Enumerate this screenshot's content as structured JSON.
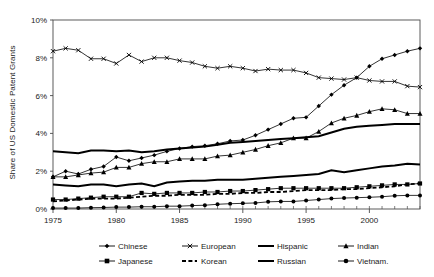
{
  "chart_data": {
    "type": "line",
    "title": "",
    "xlabel": "",
    "ylabel": "Share of US Domestic Patent Grants",
    "xlim": [
      1975,
      2004
    ],
    "ylim": [
      0,
      10
    ],
    "grid": false,
    "legend_position": "bottom",
    "x": [
      1975,
      1976,
      1977,
      1978,
      1979,
      1980,
      1981,
      1982,
      1983,
      1984,
      1985,
      1986,
      1987,
      1988,
      1989,
      1990,
      1991,
      1992,
      1993,
      1994,
      1995,
      1996,
      1997,
      1998,
      1999,
      2000,
      2001,
      2002,
      2003,
      2004
    ],
    "xticks": [
      1975,
      1980,
      1985,
      1990,
      1995,
      2000
    ],
    "xtick_labels": [
      "1975",
      "1980",
      "1985",
      "1990",
      "1995",
      "2000"
    ],
    "yticks": [
      0,
      2,
      4,
      6,
      8,
      10
    ],
    "ytick_labels": [
      "0%",
      "2%",
      "4%",
      "6%",
      "8%",
      "10%"
    ],
    "y_unit": "%",
    "series": [
      {
        "name": "Chinese",
        "marker": "diamond",
        "line": "solid",
        "values": [
          1.7,
          2.0,
          1.85,
          2.1,
          2.25,
          2.75,
          2.55,
          2.7,
          2.85,
          3.05,
          3.2,
          3.3,
          3.35,
          3.45,
          3.6,
          3.65,
          3.9,
          4.2,
          4.5,
          4.8,
          4.85,
          5.45,
          6.05,
          6.55,
          6.95,
          7.55,
          7.95,
          8.15,
          8.35,
          8.5
        ]
      },
      {
        "name": "European",
        "marker": "x",
        "line": "solid",
        "values": [
          8.35,
          8.5,
          8.4,
          7.95,
          7.95,
          7.7,
          8.15,
          7.8,
          8.0,
          8.0,
          7.85,
          7.75,
          7.55,
          7.45,
          7.55,
          7.45,
          7.3,
          7.4,
          7.35,
          7.35,
          7.2,
          6.95,
          6.9,
          6.85,
          6.95,
          6.8,
          6.75,
          6.75,
          6.5,
          6.45
        ]
      },
      {
        "name": "Hispanic",
        "marker": "none",
        "line": "solid-thick",
        "values": [
          3.05,
          3.0,
          2.95,
          3.1,
          3.1,
          3.05,
          3.1,
          3.0,
          3.05,
          3.15,
          3.2,
          3.25,
          3.3,
          3.4,
          3.5,
          3.55,
          3.6,
          3.65,
          3.7,
          3.75,
          3.8,
          3.85,
          4.05,
          4.25,
          4.35,
          4.4,
          4.45,
          4.5,
          4.5,
          4.5
        ]
      },
      {
        "name": "Indian",
        "marker": "triangle",
        "line": "solid",
        "values": [
          1.7,
          1.7,
          1.8,
          1.9,
          1.95,
          2.2,
          2.2,
          2.4,
          2.5,
          2.5,
          2.65,
          2.65,
          2.65,
          2.8,
          2.85,
          3.0,
          3.15,
          3.35,
          3.5,
          3.75,
          3.75,
          4.1,
          4.55,
          4.8,
          4.95,
          5.15,
          5.3,
          5.25,
          5.05,
          5.05
        ]
      },
      {
        "name": "Japanese",
        "marker": "square",
        "line": "solid",
        "values": [
          0.5,
          0.5,
          0.55,
          0.6,
          0.65,
          0.65,
          0.65,
          0.85,
          0.8,
          0.85,
          0.85,
          0.85,
          0.9,
          0.9,
          0.95,
          0.95,
          1.0,
          1.05,
          1.1,
          1.1,
          1.1,
          1.1,
          1.1,
          1.1,
          1.15,
          1.2,
          1.25,
          1.3,
          1.3,
          1.35
        ]
      },
      {
        "name": "Korean",
        "marker": "none",
        "line": "dashed",
        "values": [
          0.4,
          0.45,
          0.5,
          0.55,
          0.55,
          0.55,
          0.6,
          0.65,
          0.7,
          0.7,
          0.75,
          0.75,
          0.75,
          0.8,
          0.8,
          0.85,
          0.85,
          0.9,
          0.9,
          0.95,
          1.0,
          1.0,
          1.0,
          1.05,
          1.05,
          1.1,
          1.15,
          1.2,
          1.3,
          1.35
        ]
      },
      {
        "name": "Russian",
        "marker": "none",
        "line": "solid-thick",
        "values": [
          1.3,
          1.25,
          1.2,
          1.3,
          1.3,
          1.2,
          1.3,
          1.35,
          1.2,
          1.4,
          1.45,
          1.5,
          1.5,
          1.55,
          1.55,
          1.55,
          1.6,
          1.65,
          1.7,
          1.75,
          1.8,
          1.85,
          2.05,
          1.95,
          2.05,
          2.15,
          2.25,
          2.3,
          2.4,
          2.35
        ]
      },
      {
        "name": "Vietnam.",
        "marker": "circle",
        "line": "solid",
        "values": [
          0.05,
          0.05,
          0.05,
          0.07,
          0.08,
          0.1,
          0.1,
          0.12,
          0.12,
          0.15,
          0.15,
          0.18,
          0.2,
          0.25,
          0.28,
          0.3,
          0.32,
          0.38,
          0.4,
          0.4,
          0.45,
          0.5,
          0.55,
          0.58,
          0.6,
          0.62,
          0.65,
          0.7,
          0.72,
          0.72
        ]
      }
    ],
    "legend": [
      {
        "label": "Chinese",
        "marker": "diamond",
        "line": "solid"
      },
      {
        "label": "European",
        "marker": "x",
        "line": "solid"
      },
      {
        "label": "Hispanic",
        "marker": "none",
        "line": "solid-thick"
      },
      {
        "label": "Indian",
        "marker": "triangle",
        "line": "solid"
      },
      {
        "label": "Japanese",
        "marker": "square",
        "line": "solid"
      },
      {
        "label": "Korean",
        "marker": "none",
        "line": "dashed"
      },
      {
        "label": "Russian",
        "marker": "none",
        "line": "solid-thick"
      },
      {
        "label": "Vietnam.",
        "marker": "circle",
        "line": "solid"
      }
    ],
    "colors": {
      "series": "#000000",
      "axis": "#333333",
      "background": "#ffffff"
    }
  }
}
